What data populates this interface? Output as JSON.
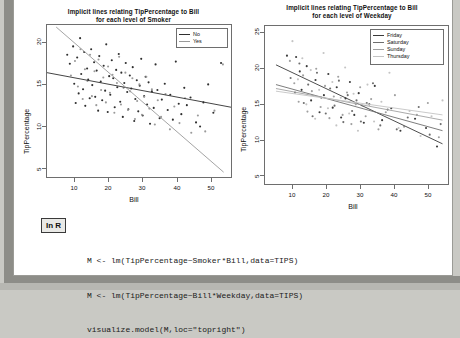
{
  "page": {
    "faint_header": "",
    "in_r_badge": "In R"
  },
  "code": {
    "lines": [
      "M <- lm(TipPercentage~Smoker*Bill,data=TIPS)",
      "M <- lm(TipPercentage~Bill*Weekday,data=TIPS)",
      "visualize.model(M,loc=\"topright\")"
    ]
  },
  "chart_data": [
    {
      "id": "smoker-plot",
      "type": "scatter",
      "title": "Implicit lines relating TipPercentage to Bill\nfor each level of Smoker",
      "title_line1": "Implicit lines relating TipPercentage to Bill",
      "title_line2": "for each level of Smoker",
      "xlabel": "Bill",
      "ylabel": "TipPercentage",
      "xlim": [
        3,
        53
      ],
      "ylim": [
        2.5,
        24.5
      ],
      "xticks": [
        10,
        20,
        30,
        40,
        50
      ],
      "yticks": [
        5,
        10,
        15,
        20
      ],
      "grid": false,
      "legend_position": "topright",
      "legend_title": "",
      "series": [
        {
          "name": "No",
          "color": "#2f2f2f",
          "fit_line": {
            "x1": 3,
            "y1": 17.6,
            "x2": 53,
            "y2": 12.6
          },
          "points": [
            [
              8.5,
              20.2
            ],
            [
              9.2,
              18.9
            ],
            [
              10.1,
              21.4
            ],
            [
              10.4,
              16.0
            ],
            [
              10.8,
              13.2
            ],
            [
              11.2,
              19.8
            ],
            [
              11.6,
              14.6
            ],
            [
              12.0,
              22.6
            ],
            [
              12.3,
              17.4
            ],
            [
              12.8,
              15.2
            ],
            [
              13.1,
              20.6
            ],
            [
              13.4,
              12.8
            ],
            [
              13.9,
              18.2
            ],
            [
              14.2,
              16.6
            ],
            [
              14.6,
              13.9
            ],
            [
              15.0,
              21.0
            ],
            [
              15.3,
              15.8
            ],
            [
              15.8,
              19.1
            ],
            [
              16.1,
              14.1
            ],
            [
              16.5,
              17.9
            ],
            [
              16.9,
              12.1
            ],
            [
              17.2,
              20.0
            ],
            [
              17.6,
              16.3
            ],
            [
              18.0,
              13.6
            ],
            [
              18.4,
              18.6
            ],
            [
              18.8,
              15.0
            ],
            [
              19.1,
              21.7
            ],
            [
              19.5,
              11.9
            ],
            [
              19.9,
              17.1
            ],
            [
              20.2,
              14.4
            ],
            [
              20.6,
              19.4
            ],
            [
              21.0,
              16.8
            ],
            [
              21.4,
              12.6
            ],
            [
              21.8,
              18.0
            ],
            [
              22.1,
              15.5
            ],
            [
              22.5,
              20.3
            ],
            [
              22.9,
              13.4
            ],
            [
              23.2,
              17.6
            ],
            [
              23.6,
              11.2
            ],
            [
              24.0,
              16.1
            ],
            [
              24.4,
              19.0
            ],
            [
              24.8,
              14.8
            ],
            [
              25.1,
              12.3
            ],
            [
              25.5,
              17.2
            ],
            [
              25.9,
              15.3
            ],
            [
              26.3,
              18.4
            ],
            [
              26.7,
              10.6
            ],
            [
              27.0,
              13.8
            ],
            [
              27.4,
              16.5
            ],
            [
              27.8,
              12.0
            ],
            [
              28.2,
              15.7
            ],
            [
              28.6,
              19.6
            ],
            [
              29.0,
              11.4
            ],
            [
              29.4,
              14.2
            ],
            [
              29.8,
              17.0
            ],
            [
              30.2,
              13.0
            ],
            [
              30.6,
              16.2
            ],
            [
              31.0,
              10.2
            ],
            [
              31.5,
              14.9
            ],
            [
              32.0,
              12.5
            ],
            [
              32.5,
              18.8
            ],
            [
              33.0,
              15.1
            ],
            [
              33.6,
              11.0
            ],
            [
              34.2,
              13.7
            ],
            [
              35.0,
              16.0
            ],
            [
              35.8,
              12.2
            ],
            [
              36.5,
              14.4
            ],
            [
              37.2,
              10.8
            ],
            [
              38.0,
              19.2
            ],
            [
              38.8,
              13.1
            ],
            [
              39.5,
              11.6
            ],
            [
              40.3,
              15.4
            ],
            [
              41.0,
              12.9
            ],
            [
              42.0,
              14.0
            ],
            [
              43.5,
              10.4
            ],
            [
              44.6,
              9.8
            ],
            [
              45.5,
              13.3
            ],
            [
              46.8,
              15.9
            ],
            [
              48.2,
              11.8
            ],
            [
              50.3,
              19.0
            ]
          ]
        },
        {
          "name": "Yes",
          "color": "#9a9a9a",
          "fit_line": {
            "x1": 5.5,
            "y1": 24.2,
            "x2": 51.0,
            "y2": 3.2
          },
          "points": [
            [
              9.5,
              17.2
            ],
            [
              10.6,
              19.3
            ],
            [
              11.4,
              15.6
            ],
            [
              12.1,
              21.0
            ],
            [
              12.7,
              13.8
            ],
            [
              13.3,
              18.1
            ],
            [
              14.0,
              16.4
            ],
            [
              14.7,
              20.2
            ],
            [
              15.2,
              14.2
            ],
            [
              15.9,
              17.8
            ],
            [
              16.4,
              12.9
            ],
            [
              17.0,
              19.5
            ],
            [
              17.7,
              15.1
            ],
            [
              18.3,
              16.9
            ],
            [
              19.0,
              13.3
            ],
            [
              19.6,
              18.5
            ],
            [
              20.1,
              14.7
            ],
            [
              20.8,
              17.3
            ],
            [
              21.3,
              11.8
            ],
            [
              22.0,
              16.1
            ],
            [
              22.6,
              19.9
            ],
            [
              23.1,
              13.0
            ],
            [
              23.8,
              15.4
            ],
            [
              24.3,
              17.6
            ],
            [
              25.0,
              12.2
            ],
            [
              25.6,
              14.9
            ],
            [
              26.2,
              16.8
            ],
            [
              26.9,
              10.9
            ],
            [
              27.5,
              13.5
            ],
            [
              28.1,
              15.9
            ],
            [
              28.8,
              11.5
            ],
            [
              29.4,
              14.1
            ],
            [
              30.0,
              17.0
            ],
            [
              30.8,
              12.4
            ],
            [
              31.5,
              15.2
            ],
            [
              32.3,
              10.1
            ],
            [
              33.1,
              13.6
            ],
            [
              34.0,
              11.2
            ],
            [
              35.2,
              14.5
            ],
            [
              36.4,
              9.4
            ],
            [
              37.6,
              12.7
            ],
            [
              39.0,
              10.3
            ],
            [
              40.5,
              13.9
            ],
            [
              42.2,
              8.9
            ],
            [
              44.0,
              11.4
            ],
            [
              46.0,
              9.1
            ],
            [
              48.5,
              12.1
            ],
            [
              50.8,
              18.8
            ]
          ]
        }
      ]
    },
    {
      "id": "weekday-plot",
      "type": "scatter",
      "title": "Implicit lines relating TipPercentage to Bill\nfor each level of Weekday",
      "title_line1": "Implicit lines relating TipPercentage to Bill",
      "title_line2": "for each level of Weekday",
      "xlabel": "Bill",
      "ylabel": "TipPercentage",
      "xlim": [
        3,
        53
      ],
      "ylim": [
        2.5,
        26.5
      ],
      "xticks": [
        10,
        20,
        30,
        40,
        50
      ],
      "yticks": [
        5,
        10,
        15,
        20,
        25
      ],
      "grid": false,
      "legend_position": "topright",
      "series": [
        {
          "name": "Friday",
          "color": "#3a3a3a",
          "fit_line": {
            "x1": 6.0,
            "y1": 20.6,
            "x2": 51.5,
            "y2": 8.6
          },
          "points": [
            [
              9.0,
              22.0
            ],
            [
              11.5,
              21.8
            ],
            [
              12.5,
              19.6
            ],
            [
              13.0,
              16.8
            ],
            [
              14.4,
              20.4
            ],
            [
              15.6,
              15.2
            ],
            [
              16.8,
              18.3
            ],
            [
              17.9,
              13.4
            ],
            [
              19.1,
              16.0
            ],
            [
              20.3,
              19.2
            ],
            [
              21.5,
              14.1
            ],
            [
              22.6,
              17.2
            ],
            [
              23.8,
              12.6
            ],
            [
              25.0,
              15.5
            ],
            [
              26.2,
              18.0
            ],
            [
              27.4,
              13.0
            ],
            [
              28.6,
              16.3
            ],
            [
              30.0,
              11.8
            ],
            [
              31.5,
              14.6
            ],
            [
              33.0,
              17.4
            ],
            [
              35.0,
              12.2
            ],
            [
              37.5,
              14.0
            ],
            [
              40.0,
              10.6
            ],
            [
              44.0,
              12.4
            ],
            [
              47.0,
              11.0
            ],
            [
              50.0,
              8.2
            ]
          ]
        },
        {
          "name": "Saturday",
          "color": "#6e6e6e",
          "fit_line": {
            "x1": 6.0,
            "y1": 17.6,
            "x2": 51.5,
            "y2": 10.6
          },
          "points": [
            [
              10.0,
              18.6
            ],
            [
              11.2,
              16.4
            ],
            [
              12.4,
              20.8
            ],
            [
              13.6,
              14.8
            ],
            [
              14.8,
              17.6
            ],
            [
              16.0,
              12.8
            ],
            [
              17.2,
              19.4
            ],
            [
              18.4,
              15.6
            ],
            [
              19.6,
              13.2
            ],
            [
              20.8,
              17.0
            ],
            [
              22.0,
              14.4
            ],
            [
              23.2,
              18.2
            ],
            [
              24.4,
              11.9
            ],
            [
              25.6,
              16.0
            ],
            [
              26.8,
              13.6
            ],
            [
              28.0,
              15.2
            ],
            [
              29.2,
              12.0
            ],
            [
              30.8,
              14.8
            ],
            [
              32.5,
              17.8
            ],
            [
              34.5,
              11.4
            ],
            [
              36.5,
              13.8
            ],
            [
              39.0,
              10.8
            ],
            [
              42.0,
              12.6
            ],
            [
              45.0,
              14.2
            ],
            [
              48.0,
              10.0
            ],
            [
              51.0,
              11.6
            ]
          ]
        },
        {
          "name": "Sunday",
          "color": "#a0a0a0",
          "fit_line": {
            "x1": 6.0,
            "y1": 17.0,
            "x2": 51.5,
            "y2": 12.2
          },
          "points": [
            [
              9.8,
              21.2
            ],
            [
              11.0,
              17.8
            ],
            [
              12.2,
              15.0
            ],
            [
              13.4,
              19.0
            ],
            [
              14.6,
              13.5
            ],
            [
              15.8,
              16.6
            ],
            [
              17.0,
              20.0
            ],
            [
              18.2,
              14.2
            ],
            [
              19.4,
              17.4
            ],
            [
              20.6,
              12.5
            ],
            [
              21.8,
              15.8
            ],
            [
              23.0,
              18.8
            ],
            [
              24.2,
              13.0
            ],
            [
              25.4,
              16.4
            ],
            [
              26.6,
              11.6
            ],
            [
              27.8,
              14.6
            ],
            [
              29.0,
              17.2
            ],
            [
              30.5,
              12.8
            ],
            [
              32.0,
              15.4
            ],
            [
              34.0,
              10.8
            ],
            [
              36.0,
              13.4
            ],
            [
              38.5,
              16.0
            ],
            [
              41.0,
              11.2
            ],
            [
              44.5,
              13.0
            ],
            [
              47.5,
              14.8
            ],
            [
              50.5,
              9.6
            ]
          ]
        },
        {
          "name": "Thursday",
          "color": "#c4c4c4",
          "fit_line": {
            "x1": 6.0,
            "y1": 16.6,
            "x2": 51.5,
            "y2": 13.0
          },
          "points": [
            [
              10.5,
              24.2
            ],
            [
              12.0,
              18.4
            ],
            [
              13.2,
              21.6
            ],
            [
              14.3,
              14.6
            ],
            [
              15.5,
              19.8
            ],
            [
              16.7,
              12.4
            ],
            [
              17.8,
              16.8
            ],
            [
              19.0,
              22.4
            ],
            [
              20.2,
              14.0
            ],
            [
              21.4,
              18.0
            ],
            [
              22.5,
              11.4
            ],
            [
              23.7,
              15.6
            ],
            [
              24.9,
              20.2
            ],
            [
              26.0,
              13.2
            ],
            [
              27.2,
              16.2
            ],
            [
              28.4,
              10.6
            ],
            [
              29.6,
              14.4
            ],
            [
              31.0,
              17.6
            ],
            [
              32.8,
              12.0
            ],
            [
              34.8,
              15.0
            ],
            [
              37.0,
              19.4
            ],
            [
              39.5,
              11.0
            ],
            [
              42.5,
              13.6
            ],
            [
              45.5,
              9.8
            ],
            [
              48.5,
              12.8
            ],
            [
              51.5,
              15.2
            ]
          ]
        }
      ]
    }
  ]
}
